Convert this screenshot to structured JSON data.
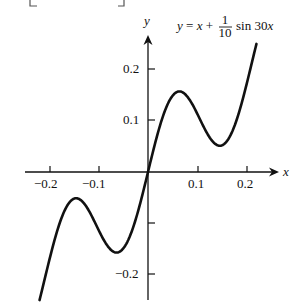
{
  "chart_data": {
    "type": "line",
    "title": "",
    "annotation": {
      "lhs": "y = x + ",
      "frac_num": "1",
      "frac_den": "10",
      "rhs": "sin 30x"
    },
    "xlabel": "x",
    "ylabel": "y",
    "xlim": [
      -0.25,
      0.265
    ],
    "ylim": [
      -0.26,
      0.27
    ],
    "xticks": [
      -0.2,
      -0.1,
      0.1,
      0.2
    ],
    "xtick_labels": [
      "−0.2",
      "−0.1",
      "0.1",
      "0.2"
    ],
    "yticks": [
      0.2,
      0.1,
      -0.1,
      -0.2
    ],
    "ytick_labels": [
      "0.2",
      "0.1",
      "",
      "−0.2"
    ],
    "grid": false,
    "legend": "none",
    "function": "y = x + 0.1*sin(30x)",
    "x_domain": [
      -0.22,
      0.22
    ],
    "series": [
      {
        "name": "y = x + (1/10) sin 30x",
        "x": [
          -0.22,
          -0.2,
          -0.18,
          -0.16,
          -0.14,
          -0.12,
          -0.1,
          -0.08,
          -0.06,
          -0.04,
          -0.02,
          0,
          0.02,
          0.04,
          0.06,
          0.08,
          0.1,
          0.12,
          0.14,
          0.16,
          0.18,
          0.2,
          0.22
        ],
        "y": [
          -0.251,
          -0.172,
          -0.102,
          -0.06,
          -0.053,
          -0.076,
          -0.114,
          -0.148,
          -0.157,
          -0.133,
          -0.076,
          0,
          0.076,
          0.133,
          0.157,
          0.148,
          0.114,
          0.076,
          0.053,
          0.06,
          0.102,
          0.172,
          0.251
        ]
      }
    ]
  }
}
